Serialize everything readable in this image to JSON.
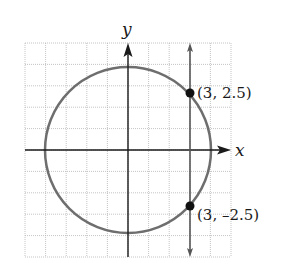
{
  "chart_data": {
    "type": "scatter",
    "title": "",
    "xlabel": "x",
    "ylabel": "y",
    "xlim": [
      -5,
      5
    ],
    "ylim": [
      -5,
      5
    ],
    "grid": true,
    "curves": [
      {
        "name": "circle",
        "kind": "circle",
        "center": [
          0,
          0
        ],
        "radius": 4,
        "color": "#6e6e6e"
      },
      {
        "name": "vertical-line",
        "kind": "vline",
        "x": 3,
        "color": "#555555",
        "arrows": "both"
      }
    ],
    "points": [
      {
        "x": 3,
        "y": 2.5,
        "label": "(3, 2.5)"
      },
      {
        "x": 3,
        "y": -2.5,
        "label": "(3, –2.5)"
      }
    ]
  },
  "labels": {
    "x_axis": "x",
    "y_axis": "y",
    "point_upper": "(3, 2.5)",
    "point_lower": "(3, –2.5)"
  }
}
